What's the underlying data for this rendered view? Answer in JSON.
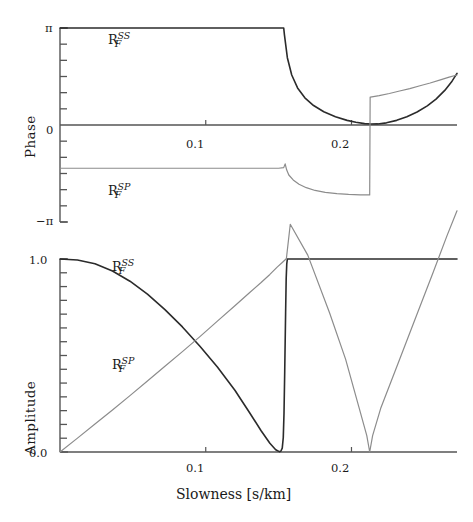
{
  "figure": {
    "xlabel": "Slowness [s/km]",
    "xticks": [
      {
        "value": 0.1,
        "label": "0.1"
      },
      {
        "value": 0.2,
        "label": "0.2"
      }
    ],
    "xlim": [
      0.0,
      0.2724
    ],
    "curve_label_ss": {
      "base": "R",
      "sub": "F",
      "sup": "SS"
    },
    "curve_label_sp": {
      "base": "R",
      "sub": "F",
      "sup": "SP"
    },
    "colors": {
      "ss": "#2b2b2b",
      "sp": "#8c8c8c",
      "axis": "#555555"
    }
  },
  "chart_data": [
    {
      "type": "line",
      "title": "",
      "xlabel": "",
      "ylabel": "Phase",
      "xlim": [
        0.0,
        0.2724
      ],
      "ylim": [
        -3.14159,
        3.14159
      ],
      "ytick_labels": [
        "π",
        "0",
        "−π"
      ],
      "ytick_values": [
        3.14159,
        0,
        -3.14159
      ],
      "grid": false,
      "legend": "inline-annotations",
      "annotations": [
        {
          "text": "R_F^SS",
          "x": 0.035,
          "y": 2.45
        },
        {
          "text": "R_F^SP",
          "x": 0.035,
          "y": -1.95
        }
      ],
      "series": [
        {
          "name": "R_F^SS",
          "color": "#2b2b2b",
          "x": [
            0.0,
            0.02,
            0.04,
            0.06,
            0.08,
            0.1,
            0.12,
            0.14,
            0.151,
            0.1535,
            0.154,
            0.156,
            0.159,
            0.163,
            0.168,
            0.174,
            0.181,
            0.189,
            0.197,
            0.203,
            0.209,
            0.2135,
            0.218,
            0.224,
            0.231,
            0.238,
            0.245,
            0.252,
            0.258,
            0.264,
            0.269,
            0.2724
          ],
          "y": [
            3.14159,
            3.14159,
            3.14159,
            3.14159,
            3.14159,
            3.14159,
            3.14159,
            3.14159,
            3.14159,
            3.14159,
            2.92,
            2.18,
            1.62,
            1.2,
            0.88,
            0.63,
            0.43,
            0.27,
            0.15,
            0.09,
            0.045,
            0.03,
            0.035,
            0.07,
            0.15,
            0.27,
            0.42,
            0.62,
            0.84,
            1.12,
            1.42,
            1.67
          ]
        },
        {
          "name": "R_F^SP",
          "color": "#8c8c8c",
          "x": [
            0.0,
            0.02,
            0.04,
            0.06,
            0.08,
            0.1,
            0.12,
            0.14,
            0.15,
            0.1535,
            0.1545,
            0.1555,
            0.157,
            0.16,
            0.164,
            0.169,
            0.175,
            0.182,
            0.19,
            0.198,
            0.206,
            0.2125,
            0.2128,
            0.213,
            0.219,
            0.226,
            0.233,
            0.24,
            0.247,
            0.254,
            0.261,
            0.267,
            0.2724
          ],
          "y": [
            -1.4,
            -1.4,
            -1.4,
            -1.4,
            -1.4,
            -1.4,
            -1.4,
            -1.4,
            -1.4,
            -1.38,
            -1.26,
            -1.45,
            -1.62,
            -1.78,
            -1.92,
            -2.03,
            -2.12,
            -2.18,
            -2.22,
            -2.25,
            -2.26,
            -2.265,
            0.9,
            0.9,
            0.95,
            1.02,
            1.1,
            1.18,
            1.27,
            1.36,
            1.46,
            1.55,
            1.62
          ]
        }
      ]
    },
    {
      "type": "line",
      "title": "",
      "xlabel": "Slowness [s/km]",
      "ylabel": "Amplitude",
      "xlim": [
        0.0,
        0.2724
      ],
      "ylim": [
        0.0,
        1.0
      ],
      "ytick_labels": [
        "1.0",
        "0.0"
      ],
      "ytick_values": [
        1.0,
        0.0
      ],
      "grid": false,
      "legend": "inline-annotations",
      "annotations": [
        {
          "text": "R_F^SS",
          "x": 0.032,
          "y": 0.955
        },
        {
          "text": "R_F^SP",
          "x": 0.032,
          "y": 0.43
        }
      ],
      "series": [
        {
          "name": "R_F^SS",
          "color": "#2b2b2b",
          "x": [
            0.0,
            0.012,
            0.024,
            0.036,
            0.048,
            0.06,
            0.072,
            0.084,
            0.096,
            0.108,
            0.12,
            0.13,
            0.138,
            0.144,
            0.148,
            0.1505,
            0.1515,
            0.1525,
            0.1532,
            0.1537,
            0.1542,
            0.1548,
            0.1552,
            0.1556,
            0.156,
            0.2724
          ],
          "y": [
            1.0,
            0.995,
            0.975,
            0.938,
            0.885,
            0.818,
            0.738,
            0.648,
            0.548,
            0.44,
            0.32,
            0.205,
            0.11,
            0.045,
            0.012,
            0.002,
            0.004,
            0.02,
            0.075,
            0.2,
            0.42,
            0.72,
            0.9,
            0.975,
            1.0,
            1.0
          ]
        },
        {
          "name": "R_F^SP",
          "color": "#8c8c8c",
          "x": [
            0.0,
            0.012,
            0.024,
            0.036,
            0.048,
            0.06,
            0.072,
            0.084,
            0.096,
            0.108,
            0.12,
            0.13,
            0.138,
            0.144,
            0.149,
            0.1525,
            0.1545,
            0.155,
            0.1553,
            0.158,
            0.17,
            0.185,
            0.196,
            0.205,
            0.2105,
            0.2125,
            0.2145,
            0.22,
            0.232,
            0.245,
            0.256,
            0.2655,
            0.2724
          ],
          "y": [
            0.0,
            0.072,
            0.145,
            0.218,
            0.292,
            0.368,
            0.444,
            0.52,
            0.598,
            0.678,
            0.758,
            0.825,
            0.878,
            0.92,
            0.958,
            0.982,
            0.996,
            1.0,
            1.0,
            1.18,
            1.02,
            0.72,
            0.48,
            0.235,
            0.085,
            0.0,
            0.085,
            0.225,
            0.46,
            0.715,
            0.93,
            1.12,
            1.25
          ]
        }
      ]
    }
  ]
}
